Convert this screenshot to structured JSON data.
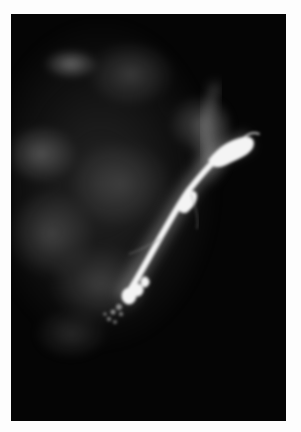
{
  "image": {
    "description": "Grayscale radiograph (galactogram) showing a bright contrast-filled duct extending diagonally from lower-center toward upper-right over diffuse gray glandular tissue on black background",
    "colors": {
      "border": "#fdfdfd",
      "background": "#050505",
      "tissue": "#808080",
      "contrast": "#ffffff"
    }
  }
}
